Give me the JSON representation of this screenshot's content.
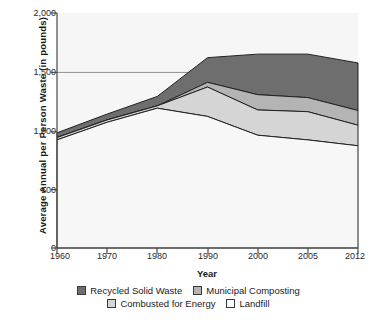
{
  "chart_data": {
    "type": "area",
    "stacked": true,
    "title": "",
    "xlabel": "Year",
    "ylabel": "Average Annual per Person Waste (in pounds)",
    "categories": [
      "1960",
      "1970",
      "1980",
      "1990",
      "2000",
      "2005",
      "2012"
    ],
    "x": [
      1960,
      1970,
      1980,
      1990,
      2000,
      2005,
      2012
    ],
    "ylim": [
      0,
      2000
    ],
    "yticks": [
      0,
      500,
      1000,
      1500,
      2000
    ],
    "ytick_labels": [
      "0",
      "500",
      "1,000",
      "1,500",
      "2,000"
    ],
    "xtick_labels": [
      "1960",
      "1970",
      "1980",
      "1990",
      "2000",
      "2005",
      "2012"
    ],
    "grid": "horizontal-1500-only",
    "legend_position": "bottom",
    "series": [
      {
        "name": "Landfill",
        "color": "#f4f4f4",
        "values": [
          920,
          1070,
          1190,
          1120,
          960,
          920,
          870
        ]
      },
      {
        "name": "Combusted for Energy",
        "color": "#d5d5d5",
        "values": [
          20,
          20,
          20,
          250,
          215,
          240,
          175
        ]
      },
      {
        "name": "Municipal Composting",
        "color": "#b4b4b4",
        "values": [
          0,
          0,
          0,
          40,
          130,
          120,
          125
        ]
      },
      {
        "name": "Recycled Solid Waste",
        "color": "#6e6e6e",
        "values": [
          40,
          50,
          80,
          210,
          345,
          370,
          405
        ]
      }
    ],
    "cumulative_tops": {
      "landfill": [
        920,
        1070,
        1190,
        1120,
        960,
        920,
        870
      ],
      "combusted_for_energy": [
        940,
        1090,
        1210,
        1370,
        1175,
        1160,
        1045
      ],
      "municipal_composting": [
        940,
        1090,
        1210,
        1410,
        1305,
        1280,
        1170
      ],
      "total": [
        980,
        1140,
        1290,
        1620,
        1650,
        1650,
        1575
      ]
    }
  },
  "axes": {
    "y_title": "Average Annual per Person Waste (in pounds)",
    "x_title": "Year",
    "y_ticks": [
      "2,000",
      "1,500",
      "1,000",
      "500",
      "0"
    ],
    "x_ticks": [
      "1960",
      "1970",
      "1980",
      "1990",
      "2000",
      "2005",
      "2012"
    ]
  },
  "legend": {
    "row1": [
      {
        "label": "Recycled Solid Waste",
        "color": "#6e6e6e"
      },
      {
        "label": "Municipal Composting",
        "color": "#b4b4b4"
      }
    ],
    "row2": [
      {
        "label": "Combusted for Energy",
        "color": "#d5d5d5"
      },
      {
        "label": "Landfill",
        "color": "#fbfbfb"
      }
    ]
  }
}
